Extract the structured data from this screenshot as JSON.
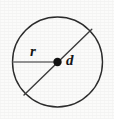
{
  "figure": {
    "canvas": {
      "width": 114,
      "height": 119,
      "background": "#fbfbfa"
    },
    "circle": {
      "name": "circle-outline",
      "center_x": 57.5,
      "center_y": 62,
      "radius": 45,
      "stroke_color": "#2b2b2b",
      "stroke_width": 1.4,
      "fill": "none"
    },
    "center_point": {
      "name": "center-dot",
      "x": 57.5,
      "y": 62,
      "dot_radius": 4.2,
      "color": "#111111"
    },
    "radius_segment": {
      "name": "radius-line",
      "x1": 12.6,
      "y1": 62,
      "x2": 57.5,
      "y2": 62,
      "stroke_color": "#6f6f6f",
      "stroke_width": 1.6
    },
    "diameter_segment": {
      "name": "diameter-line",
      "x1": 24.0,
      "y1": 95.0,
      "x2": 91.8,
      "y2": 29.2,
      "stroke_color": "#3a3a3a",
      "stroke_width": 1.4
    },
    "labels": {
      "radius": "r",
      "diameter": "d"
    }
  }
}
